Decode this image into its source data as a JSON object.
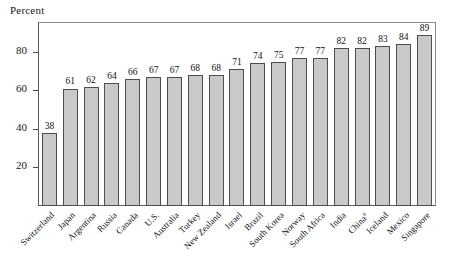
{
  "chart_data": {
    "type": "bar",
    "title": "",
    "ylabel": "Percent",
    "xlabel": "",
    "ylim": [
      0,
      95
    ],
    "yticks": [
      20,
      40,
      60,
      80
    ],
    "grid": false,
    "legend": null,
    "categories": [
      "Switzerland",
      "Japan",
      "Argentina",
      "Russia",
      "Canada",
      "U.S.",
      "Australia",
      "Turkey",
      "New Zealand",
      "Israel",
      "Brazil",
      "South Korea",
      "Norway",
      "South Africa",
      "India",
      "China",
      "Iceland",
      "Mexico",
      "Singapore"
    ],
    "category_footnotes": {
      "China": "a"
    },
    "values": [
      38,
      61,
      62,
      64,
      66,
      67,
      67,
      68,
      68,
      71,
      74,
      75,
      77,
      77,
      82,
      82,
      83,
      84,
      89
    ],
    "value_labels": [
      "38",
      "61",
      "62",
      "64",
      "66",
      "67",
      "67",
      "68",
      "68",
      "71",
      "74",
      "75",
      "77",
      "77",
      "82",
      "82",
      "83",
      "84",
      "89"
    ],
    "bar_color": "#c9c9c9",
    "bar_edge_color": "#4d4d4d",
    "axis_color": "#5a5a5a",
    "text_color": "#111111"
  }
}
